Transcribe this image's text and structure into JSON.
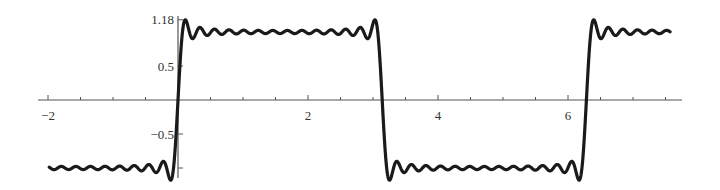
{
  "chart_data": {
    "type": "line",
    "title": "",
    "xlabel": "",
    "ylabel": "",
    "function": "(4/pi) * sum_{k=1..14} sin((2k-1)x)/(2k-1)",
    "harmonics": 14,
    "x_range_curve": [
      -1.98,
      7.57
    ],
    "xlim": [
      -2.15,
      7.75
    ],
    "ylim": [
      -1.25,
      1.25
    ],
    "x_ticks": [
      -2,
      2,
      4,
      6
    ],
    "x_tick_labels": [
      "−2",
      "2",
      "4",
      "6"
    ],
    "x_minor_step": 0.5,
    "y_ticks": [
      1.18,
      0.5,
      -0.5,
      -1
    ],
    "y_tick_labels": [
      "1.18",
      "0.5",
      "−0.5",
      ""
    ],
    "grid": false,
    "legend": null,
    "series": [
      {
        "name": "square-wave-fourier-sum",
        "color": "#1a1a1a",
        "line_width": 3.2
      }
    ],
    "annotations": [
      "Overshoot peak marked at y = 1.18"
    ]
  },
  "axes": {
    "color": "#555555"
  }
}
